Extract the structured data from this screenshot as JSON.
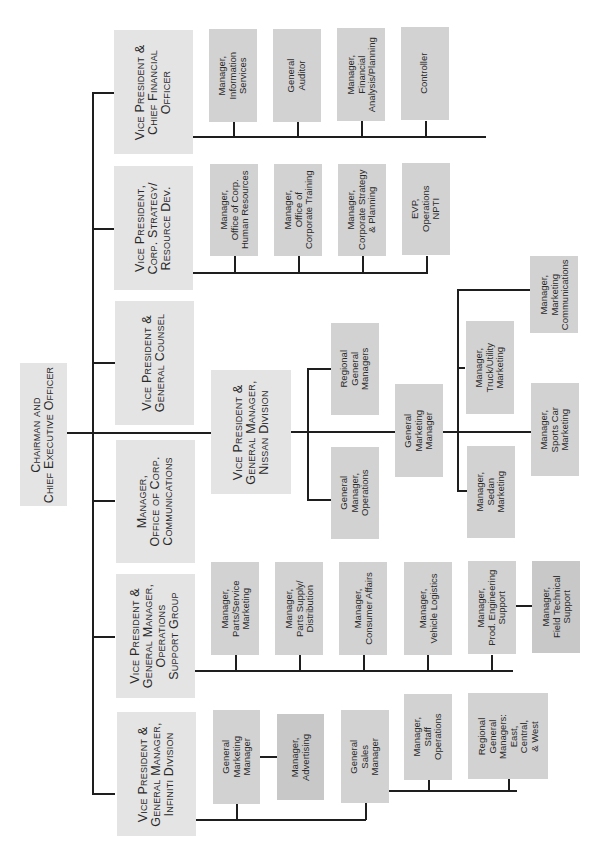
{
  "chart_title": "Organization Chart",
  "orientation": "rotated-90-ccw",
  "colors": {
    "executive_box": "#e4e4e4",
    "manager_box": "#d2d2d2",
    "manager_box_dark": "#c8c8c8",
    "connector": "#1e1e1e"
  },
  "root": {
    "title": "Chairman and\nChief Executive Officer"
  },
  "executives": [
    {
      "id": "cfo",
      "title": "Vice President &\nChief Financial\nOfficer",
      "reports": [
        "Manager,\nInformation\nServices",
        "General\nAuditor",
        "Manager,\nFinancial\nAnalysis/Planning",
        "Controller"
      ]
    },
    {
      "id": "strategy",
      "title": "Vice President,\nCorp. Strategy/\nResource Dev.",
      "reports": [
        "Manager,\nOffice of Corp.\nHuman Resources",
        "Manager,\nOffice of\nCorporate Training",
        "Manager,\nCorporate Strategy\n& Planning",
        "EVP,\nOperations\nNPTI"
      ]
    },
    {
      "id": "counsel",
      "title": "Vice President &\nGeneral Counsel",
      "reports": []
    },
    {
      "id": "nissan",
      "title": "Vice President &\nGeneral Manager,\nNissan Division",
      "reports": [
        "Regional\nGeneral\nManagers",
        "General\nManager,\nOperations"
      ],
      "marketing": {
        "title": "General\nMarketing\nManager",
        "reports": [
          "Manager,\nTruck/Utility\nMarketing",
          "Manager,\nMarketing\nCommunications",
          "Manager,\nSports Car\nMarketing",
          "Manager,\nSedan\nMarketing"
        ]
      }
    },
    {
      "id": "communications",
      "title": "Manager,\nOffice of Corp.\nCommunications",
      "reports": []
    },
    {
      "id": "operations",
      "title": "Vice President &\nGeneral Manager,\nOperations\nSupport Group",
      "reports": [
        "Manager,\nParts/Service\nMarketing",
        "Manager,\nParts Supply/\nDistribution",
        "Manager,\nConsumer Affairs",
        "Manager,\nVehicle Logistics",
        "Manager,\nProd. Engineering\nSupport",
        "Manager,\nField Technical\nSupport"
      ]
    },
    {
      "id": "infiniti",
      "title": "Vice President &\nGeneral Manager,\nInfiniti Division",
      "reports": [
        "General\nMarketing\nManager",
        "Manager,\nAdvertising",
        "General\nSales\nManager",
        "Manager,\nStaff\nOperations",
        "Regional\nGeneral\nManagers:\nEast,\nCentral,\n& West"
      ]
    }
  ]
}
